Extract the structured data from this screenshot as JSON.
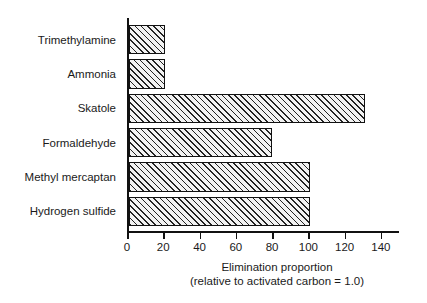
{
  "chart_data": {
    "type": "bar",
    "orientation": "horizontal",
    "title": "",
    "xlabel_lines": [
      "Elimination proportion",
      "(relative to activated carbon = 1.0)"
    ],
    "ylabel": "",
    "categories": [
      "Trimethylamine",
      "Ammonia",
      "Skatole",
      "Formaldehyde",
      "Methyl mercaptan",
      "Hydrogen sulfide"
    ],
    "values": [
      20,
      20,
      130,
      79,
      100,
      100
    ],
    "xlim": [
      0,
      150
    ],
    "xticks": [
      0,
      20,
      40,
      60,
      80,
      100,
      120,
      140
    ],
    "xtick_labels": [
      "0",
      "20",
      "40",
      "60",
      "80",
      "100",
      "120",
      "140"
    ],
    "grid": false,
    "legend": null,
    "bar_style": {
      "fill": "#f2f2f2",
      "hatch": "diagonal-45",
      "hatch_color": "#222222",
      "edge_color": "#111111"
    },
    "axis_color": "#111111",
    "background": "#ffffff",
    "text_color": "#1a1a1a"
  }
}
